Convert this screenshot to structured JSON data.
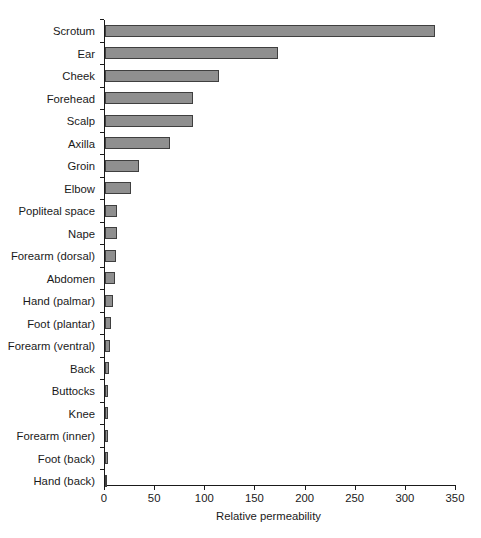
{
  "chart_data": {
    "type": "bar",
    "orientation": "horizontal",
    "title": "",
    "xlabel": "Relative permeability",
    "ylabel": "",
    "xlim": [
      0,
      350
    ],
    "xticks": [
      0,
      50,
      100,
      150,
      200,
      250,
      300,
      350
    ],
    "grid": false,
    "legend": null,
    "bar_fill_color": "#8f8f8f",
    "bar_edge_color": "#3f3f3f",
    "axis_color": "#1a1a1a",
    "background_color": "#ffffff",
    "categories": [
      "Scrotum",
      "Ear",
      "Cheek",
      "Forehead",
      "Scalp",
      "Axilla",
      "Groin",
      "Elbow",
      "Popliteal space",
      "Nape",
      "Forearm (dorsal)",
      "Abdomen",
      "Hand (palmar)",
      "Foot (plantar)",
      "Forearm (ventral)",
      "Back",
      "Buttocks",
      "Knee",
      "Forearm (inner)",
      "Foot (back)",
      "Hand (back)"
    ],
    "values": [
      329,
      173,
      114,
      88,
      88,
      65,
      34,
      26,
      12,
      12,
      11,
      10,
      8,
      6,
      5,
      4,
      3,
      3,
      3,
      3,
      1
    ]
  }
}
